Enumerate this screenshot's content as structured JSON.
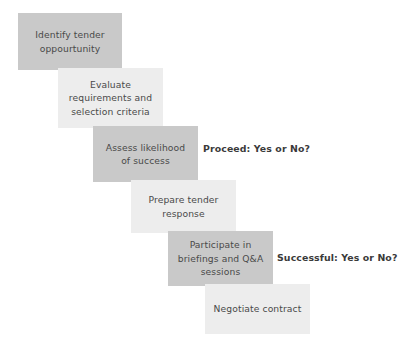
{
  "diagram": {
    "background_color": "#ffffff",
    "box_shade_dark": "#c9c9c9",
    "box_shade_light": "#ededed",
    "text_color": "#4a4a4a",
    "label_color": "#3a3a3a",
    "steps": [
      {
        "id": "step-1",
        "name": "identify-tender-opportunity",
        "text": "Identify tender\noppourtunity",
        "shade": "dark",
        "x": 18,
        "y": 13,
        "width": 104,
        "height": 57
      },
      {
        "id": "step-2",
        "name": "evaluate-requirements",
        "text": "Evaluate\nrequirements and\nselection criteria",
        "shade": "light",
        "x": 58,
        "y": 68,
        "width": 105,
        "height": 60
      },
      {
        "id": "step-3",
        "name": "assess-likelihood-of-success",
        "text": "Assess likelihood\nof success",
        "shade": "dark",
        "x": 93,
        "y": 126,
        "width": 105,
        "height": 56
      },
      {
        "id": "step-4",
        "name": "prepare-tender-response",
        "text": "Prepare tender\nresponse",
        "shade": "light",
        "x": 131,
        "y": 180,
        "width": 105,
        "height": 53
      },
      {
        "id": "step-5",
        "name": "participate-in-briefings",
        "text": "Participate in\nbriefings and Q&A\nsessions",
        "shade": "dark",
        "x": 168,
        "y": 231,
        "width": 105,
        "height": 55
      },
      {
        "id": "step-6",
        "name": "negotiate-contract",
        "text": "Negotiate contract",
        "shade": "light",
        "x": 205,
        "y": 284,
        "width": 105,
        "height": 50
      }
    ],
    "decisions": [
      {
        "id": "decision-1",
        "name": "proceed-decision-label",
        "text": "Proceed: Yes or No?",
        "x": 203,
        "y": 143
      },
      {
        "id": "decision-2",
        "name": "successful-decision-label",
        "text": "Successful: Yes or No?",
        "x": 277,
        "y": 252
      }
    ]
  }
}
